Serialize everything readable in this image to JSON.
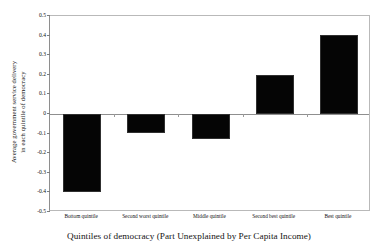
{
  "chart_data": {
    "type": "bar",
    "title": "",
    "subtitle": "",
    "categories": [
      "Bottom quintile",
      "Second worst quintile",
      "Middle quintile",
      "Second best quintile",
      "Best quintile"
    ],
    "values": [
      -0.4,
      -0.095,
      -0.125,
      0.2,
      0.405
    ],
    "series": [
      {
        "name": "Average government service delivery",
        "values": [
          -0.4,
          -0.095,
          -0.125,
          0.2,
          0.405
        ]
      }
    ],
    "xlabel": "Quintiles of democracy (Part Unexplained by Per Capita Income)",
    "ylabel": "Average government service delivery in each quintile of democracy",
    "ylabel_line1": "Average government service delivery",
    "ylabel_line2": "in each quintile of democracy",
    "ylim": [
      -0.5,
      0.5
    ],
    "ytick_values": [
      0.5,
      0.4,
      0.3,
      0.2,
      0.1,
      0,
      -0.1,
      -0.2,
      -0.3,
      -0.4,
      -0.5
    ],
    "ytick_labels": [
      "0.5",
      "0.4",
      "0.3",
      "0.2",
      "0.1",
      "0",
      "-0.1",
      "-0.2",
      "-0.3",
      "-0.4",
      "-0.5"
    ],
    "grid": false,
    "legend": null,
    "legend_position": "none",
    "zero_line": true,
    "bar_color": "#050505",
    "frame_color": "#b9b9b9",
    "axis_color": "#8f8f8f",
    "background": "#ffffff",
    "annotations": []
  }
}
